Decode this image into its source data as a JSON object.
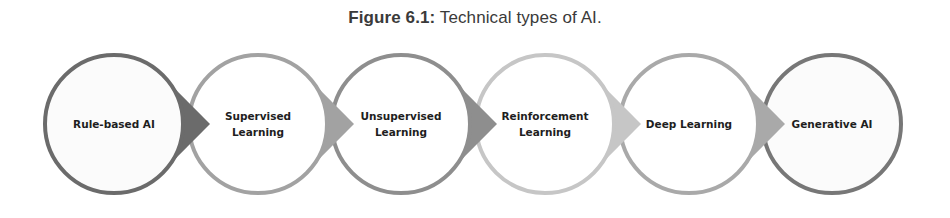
{
  "caption": {
    "label": "Figure 6.1:",
    "text": " Technical types of AI."
  },
  "diagram": {
    "type": "process-flow",
    "direction": "left-to-right",
    "nodes": [
      {
        "label_lines": [
          "Rule-based AI"
        ],
        "border_color": "#6b6b6b",
        "arrow_color": "#6b6b6b",
        "fill": "#fbfbfb"
      },
      {
        "label_lines": [
          "Supervised",
          "Learning"
        ],
        "border_color": "#a2a2a2",
        "arrow_color": "#a2a2a2",
        "fill": "#ffffff"
      },
      {
        "label_lines": [
          "Unsupervised",
          "Learning"
        ],
        "border_color": "#8e8e8e",
        "arrow_color": "#8e8e8e",
        "fill": "#ffffff"
      },
      {
        "label_lines": [
          "Reinforcement",
          "Learning"
        ],
        "border_color": "#c6c6c6",
        "arrow_color": "#c6c6c6",
        "fill": "#ffffff"
      },
      {
        "label_lines": [
          "Deep Learning"
        ],
        "border_color": "#a9a9a9",
        "arrow_color": "#a9a9a9",
        "fill": "#ffffff"
      },
      {
        "label_lines": [
          "Generative AI"
        ],
        "border_color": "#777777",
        "arrow_color": null,
        "fill": "#fbfbfb"
      }
    ]
  }
}
